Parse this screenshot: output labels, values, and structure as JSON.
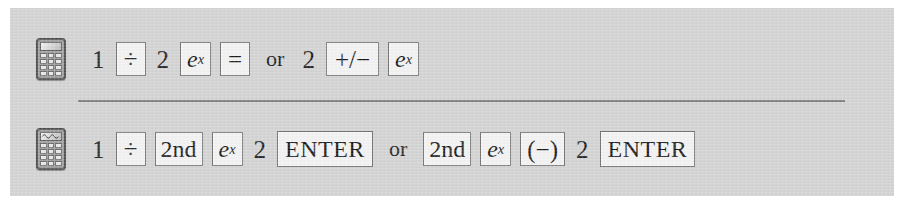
{
  "figure": {
    "background_color": "#d2d2d2",
    "page_background_color": "#ffffff",
    "divider_color": "#6f6f6f"
  },
  "rows": [
    {
      "id": "scientific",
      "icon": "scientific-calculator-icon",
      "sequence_text": "1 ÷ 2 e^x = or 2 +/- e^x",
      "tokens": [
        {
          "type": "plain",
          "label": "1"
        },
        {
          "type": "key",
          "label": "÷"
        },
        {
          "type": "plain",
          "label": "2"
        },
        {
          "type": "key-exp",
          "base": "e",
          "exponent": "x"
        },
        {
          "type": "key",
          "label": "="
        },
        {
          "type": "word",
          "label": "or"
        },
        {
          "type": "plain",
          "label": "2"
        },
        {
          "type": "key",
          "label": "+/−"
        },
        {
          "type": "key-exp",
          "base": "e",
          "exponent": "x"
        }
      ]
    },
    {
      "id": "graphing",
      "icon": "graphing-calculator-icon",
      "sequence_text": "1 ÷ 2nd e^x 2 ENTER or 2nd e^x (−) 2 ENTER",
      "tokens": [
        {
          "type": "plain",
          "label": "1"
        },
        {
          "type": "key",
          "label": "÷"
        },
        {
          "type": "key",
          "label": "2nd"
        },
        {
          "type": "key-exp",
          "base": "e",
          "exponent": "x"
        },
        {
          "type": "plain",
          "label": "2"
        },
        {
          "type": "key",
          "label": "ENTER"
        },
        {
          "type": "word",
          "label": "or"
        },
        {
          "type": "key",
          "label": "2nd"
        },
        {
          "type": "key-exp",
          "base": "e",
          "exponent": "x"
        },
        {
          "type": "key",
          "label": "(−)"
        },
        {
          "type": "plain",
          "label": "2"
        },
        {
          "type": "key",
          "label": "ENTER"
        }
      ]
    }
  ],
  "row_scientific": {
    "t1": "1",
    "t2": "÷",
    "t3": "2",
    "t4_base": "e",
    "t4_exp": "x",
    "t5": "=",
    "t6": "or",
    "t7": "2",
    "t8": "+/−",
    "t9_base": "e",
    "t9_exp": "x"
  },
  "row_graphing": {
    "t1": "1",
    "t2": "÷",
    "t3": "2nd",
    "t4_base": "e",
    "t4_exp": "x",
    "t5": "2",
    "t6": "ENTER",
    "t7": "or",
    "t8": "2nd",
    "t9_base": "e",
    "t9_exp": "x",
    "t10": "(−)",
    "t11": "2",
    "t12": "ENTER"
  }
}
